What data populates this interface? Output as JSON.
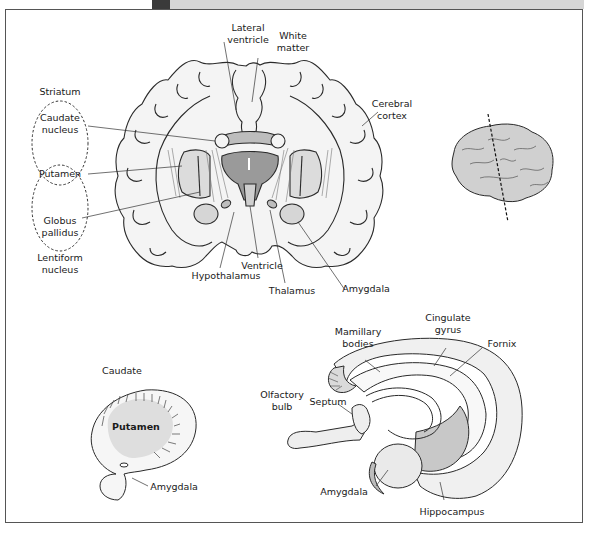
{
  "figure": {
    "colors": {
      "frame": "#555555",
      "header_dark": "#3a3a3a",
      "header_light": "#d6d6d6",
      "outline": "#2a2a2a",
      "light_fill": "#ececec",
      "mid_fill": "#cfcfcf",
      "dark_fill": "#9a9a9a"
    },
    "coronal_section": {
      "labels": {
        "lateral_ventricle": "Lateral\nventricle",
        "white_matter": "White\nmatter",
        "cerebral_cortex": "Cerebral\ncortex",
        "striatum": "Striatum",
        "caudate_nucleus": "Caudate\nnucleus",
        "putamen": "Putamen",
        "globus_pallidus": "Globus\npallidus",
        "lentiform_nucleus": "Lentiform\nnucleus",
        "hypothalamus": "Hypothalamus",
        "ventricle": "Ventricle",
        "thalamus": "Thalamus",
        "amygdala": "Amygdala"
      }
    },
    "inset_brain": {
      "description": "Lateral view of brain with dashed line indicating coronal section plane"
    },
    "basal_ganglia": {
      "labels": {
        "caudate": "Caudate",
        "putamen": "Putamen",
        "amygdala": "Amygdala"
      }
    },
    "limbic_system": {
      "labels": {
        "mamillary_bodies": "Mamillary\nbodies",
        "cingulate_gyrus": "Cingulate\ngyrus",
        "fornix": "Fornix",
        "olfactory_bulb": "Olfactory\nbulb",
        "septum": "Septum",
        "amygdala": "Amygdala",
        "hippocampus": "Hippocampus"
      }
    }
  }
}
